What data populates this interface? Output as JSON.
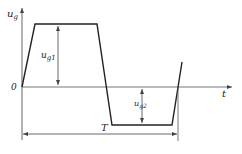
{
  "diagram": {
    "type": "trapezoidal-waveform",
    "y_axis_label": {
      "main": "u",
      "sub": "g"
    },
    "x_axis_label": "t",
    "origin_label": "0",
    "upper_amplitude_label": {
      "main": "u",
      "sub": "g1"
    },
    "lower_amplitude_label": {
      "main": "u",
      "sub": "g2"
    },
    "period_label": "T",
    "colors": {
      "waveform": "#222222",
      "axis": "#555555",
      "dimension": "#444444"
    }
  }
}
